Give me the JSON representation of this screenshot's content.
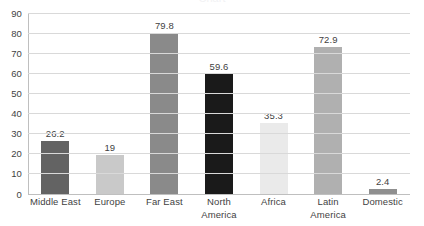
{
  "chart_data": {
    "type": "bar",
    "title": "",
    "xlabel": "",
    "ylabel": "",
    "categories": [
      "Middle East",
      "Europe",
      "Far East",
      "North\nAmerica",
      "Africa",
      "Latin America",
      "Domestic"
    ],
    "values": [
      26.2,
      19,
      79.8,
      59.6,
      35.3,
      72.9,
      2.4
    ],
    "value_labels": [
      "26.2",
      "19",
      "79.8",
      "59.6",
      "35.3",
      "72.9",
      "2.4"
    ],
    "bar_colors": [
      "#636363",
      "#c9c9c9",
      "#8a8a8a",
      "#1a1a1a",
      "#eaeaea",
      "#b0b0b0",
      "#8f8f8f"
    ],
    "ylim": [
      0,
      90
    ],
    "y_ticks": [
      0,
      10,
      20,
      30,
      40,
      50,
      60,
      70,
      80,
      90
    ],
    "y_tick_labels": [
      "0",
      "10",
      "20",
      "30",
      "40",
      "50",
      "60",
      "70",
      "80",
      "90"
    ],
    "grid": "horizontal",
    "legend": "none",
    "data_labels": true,
    "background_color": "#ffffff",
    "gridline_color": "#d9d9d9",
    "axis_color": "#bfbfbf",
    "text_color": "#3f3f3f"
  },
  "clipped_title": "Chart"
}
